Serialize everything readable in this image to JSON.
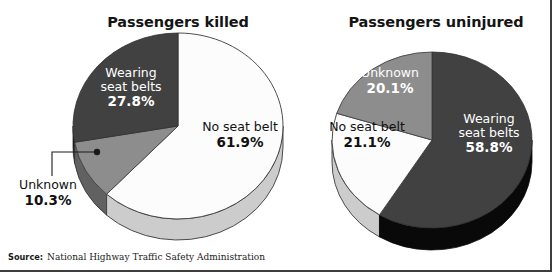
{
  "figure": {
    "source_label": "Source:",
    "source_text": "National Highway Traffic Safety Administration",
    "colors": {
      "dark_slice": "#3f3f3f",
      "dark_slice_side": "#0b0b0b",
      "mid_slice": "#8a8a8a",
      "mid_slice_side": "#5c5c5c",
      "light_slice": "#fbfbfb",
      "light_slice_side": "#c9c9c9",
      "outline": "#3a3a3a",
      "frame": "#3d3d3d",
      "label_on_dark": "#ffffff",
      "label_on_light": "#111111"
    }
  },
  "chart_data": [
    {
      "type": "pie",
      "title": "Passengers killed",
      "unit": "%",
      "categories": [
        "No seat belt",
        "Unknown",
        "Wearing seat belts"
      ],
      "values": [
        61.9,
        10.3,
        27.8
      ],
      "labels": [
        {
          "name": "No seat belt",
          "pct": "61.9%",
          "value": 61.9,
          "fill": "light"
        },
        {
          "name": "Unknown",
          "pct": "10.3%",
          "value": 10.3,
          "fill": "mid",
          "callout": true
        },
        {
          "name": "Wearing\nseat belts",
          "pct": "27.8%",
          "value": 27.8,
          "fill": "dark"
        }
      ],
      "legend": "none",
      "start_angle_deg": 0,
      "direction": "clockwise"
    },
    {
      "type": "pie",
      "title": "Passengers uninjured",
      "unit": "%",
      "categories": [
        "Wearing seat belts",
        "No seat belt",
        "Unknown"
      ],
      "values": [
        58.8,
        21.1,
        20.1
      ],
      "labels": [
        {
          "name": "Wearing\nseat belts",
          "pct": "58.8%",
          "value": 58.8,
          "fill": "dark"
        },
        {
          "name": "No seat belt",
          "pct": "21.1%",
          "value": 21.1,
          "fill": "light"
        },
        {
          "name": "Unknown",
          "pct": "20.1%",
          "value": 20.1,
          "fill": "mid"
        }
      ],
      "legend": "none",
      "start_angle_deg": 0,
      "direction": "clockwise"
    }
  ],
  "left_chart": {
    "title": "Passengers killed",
    "wearing_name": "Wearing",
    "wearing_name2": "seat belts",
    "wearing_pct": "27.8%",
    "noseat_name": "No seat belt",
    "noseat_pct": "61.9%",
    "unknown_name": "Unknown",
    "unknown_pct": "10.3%"
  },
  "right_chart": {
    "title": "Passengers uninjured",
    "unknown_name": "Unknown",
    "unknown_pct": "20.1%",
    "noseat_name": "No seat belt",
    "noseat_pct": "21.1%",
    "wearing_name": "Wearing",
    "wearing_name2": "seat belts",
    "wearing_pct": "58.8%"
  }
}
